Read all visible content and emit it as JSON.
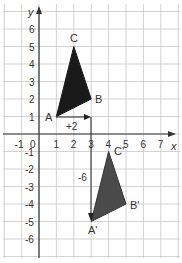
{
  "diagram": {
    "axes": {
      "x_label": "x",
      "y_label": "y",
      "x_ticks": [
        "-1",
        "0",
        "1",
        "2",
        "3",
        "4",
        "5",
        "6",
        "7"
      ],
      "y_ticks_pos": [
        "1",
        "2",
        "3",
        "4",
        "5",
        "6"
      ],
      "y_ticks_neg": [
        "-1",
        "-2",
        "-3",
        "-4",
        "-5",
        "-6"
      ]
    },
    "original_triangle": {
      "labels": {
        "A": "A",
        "B": "B",
        "C": "C"
      },
      "points": {
        "A": [
          1,
          1
        ],
        "B": [
          3,
          2
        ],
        "C": [
          2,
          5
        ]
      }
    },
    "image_triangle": {
      "labels": {
        "A": "A'",
        "B": "B'",
        "C": "C'"
      },
      "points": {
        "A": [
          3,
          -5
        ],
        "B": [
          5,
          -4
        ],
        "C": [
          4,
          -1
        ]
      }
    },
    "translation": {
      "horizontal_label": "+2",
      "vertical_label": "-6"
    },
    "colors": {
      "grid": "#c8c8c8",
      "axis": "#333333",
      "triangle_original": "#1a1a1a",
      "triangle_image": "#4a4a4a"
    }
  }
}
